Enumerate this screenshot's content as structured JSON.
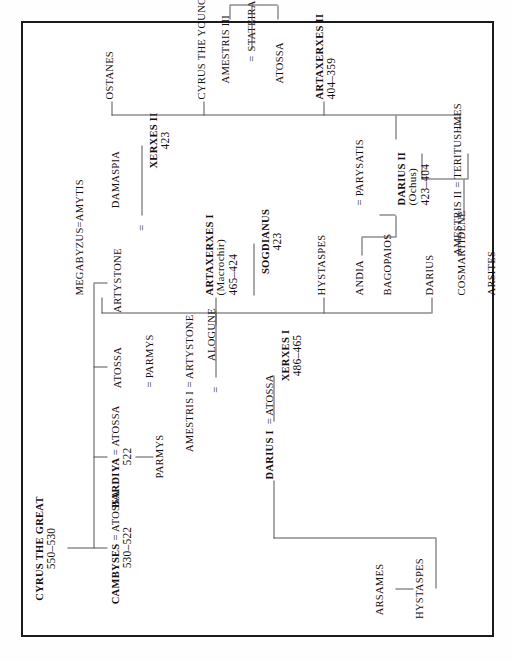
{
  "diagram": {
    "title_node": "CYRUS THE GREAT",
    "orientation": "rotated-90-ccw",
    "frame_color": "#1b1b1b",
    "line_color": "#555555",
    "type": "genealogy-tree"
  },
  "nodes": {
    "cyrus_the_great": {
      "name": "CYRUS THE GREAT",
      "dates": "550–530"
    },
    "cambyses": {
      "name": "CAMBYSES",
      "consort": "= ATOSSA",
      "dates": "530–522"
    },
    "bardiya": {
      "name": "BARDIYA",
      "consort": "= ATOSSA",
      "dates": "522"
    },
    "atossa_c": {
      "name": "ATOSSA"
    },
    "artystone_c": {
      "name": "ARTYSTONE"
    },
    "parmys_child": {
      "name": "PARMYS"
    },
    "arsames": {
      "name": "ARSAMES"
    },
    "hystaspes_top": {
      "name": "HYSTASPES"
    },
    "darius_i": {
      "name": "DARIUS I",
      "consort": "= ATOSSA"
    },
    "eq_artystone": {
      "name": "= ARTYSTONE"
    },
    "eq_parmys": {
      "name": "= PARMYS"
    },
    "xerxes_i": {
      "name": "XERXES I",
      "dates": "486–465"
    },
    "eq_amestris": {
      "name": "="
    },
    "amestris_i": {
      "name": "AMESTRIS I"
    },
    "megabyzus_amytis": {
      "name": "MEGABYZUS=AMYTIS"
    },
    "artaxerxes_i": {
      "name": "ARTAXERXES I",
      "epithet": "(Macrochir)",
      "dates": "465–424"
    },
    "eq_damaspia": {
      "name": "="
    },
    "damaspia": {
      "name": "DAMASPIA"
    },
    "alogune": {
      "name": "ALOGUNE"
    },
    "sogdianus": {
      "name": "SOGDIANUS",
      "dates": "423"
    },
    "xerxes_ii": {
      "name": "XERXES II",
      "dates": "423"
    },
    "darius_mid": {
      "name": "DARIUS"
    },
    "hystaspes_mid": {
      "name": "HYSTASPES"
    },
    "cosmartidene": {
      "name": "COSMARTIDENE"
    },
    "andia": {
      "name": "ANDIA"
    },
    "bagopaios": {
      "name": "BAGOPAIOS"
    },
    "arsites": {
      "name": "ARSITES"
    },
    "parysatis": {
      "name": "= PARYSATIS"
    },
    "darius_ii": {
      "name": "DARIUS II",
      "epithet": "(Ochus)",
      "dates": "423–404"
    },
    "amestris_ii": {
      "name": "AMESTRIS II = TERITUSHMES"
    },
    "artaxerxes_ii": {
      "name": "ARTAXERXES II",
      "dates": "404–359"
    },
    "eq_stateira": {
      "name": "="
    },
    "stateira": {
      "name": "STATEIRA"
    },
    "amestris_iii": {
      "name": "AMESTRIS III"
    },
    "atossa_b": {
      "name": "ATOSSA"
    },
    "cyrus_the_younger": {
      "name": "CYRUS THE YOUNGER"
    },
    "ostanes": {
      "name": "OSTANES"
    }
  }
}
